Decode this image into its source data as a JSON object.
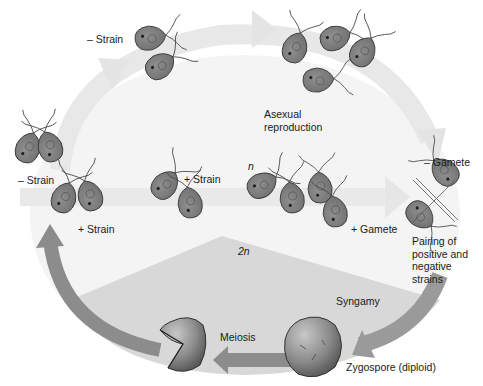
{
  "phases": {
    "haploid_label": "n",
    "diploid_label": "2n"
  },
  "labels": {
    "minus_strain_top": "– Strain",
    "minus_strain_left": "– Strain",
    "plus_strain_left": "+ Strain",
    "plus_strain_mid": "+ Strain",
    "asexual": "Asexual\nreproduction",
    "minus_gamete": "– Gamete",
    "plus_gamete": "+ Gamete",
    "pairing": "Pairing of\npositive and\nnegative\nstrains",
    "syngamy": "Syngamy",
    "zygospore": "Zygospore (diploid)",
    "meiosis": "Meiosis"
  },
  "colors": {
    "haploid_bg": "#f2f2f2",
    "diploid_bg": "#d9d9d9",
    "arrow_light": "#e6e6e6",
    "arrow_dark": "#8c8c8c",
    "cell_fill": "#7f7f7f",
    "cell_stroke": "#3c3c3c",
    "zygote_fill": "#8a8a8a"
  }
}
